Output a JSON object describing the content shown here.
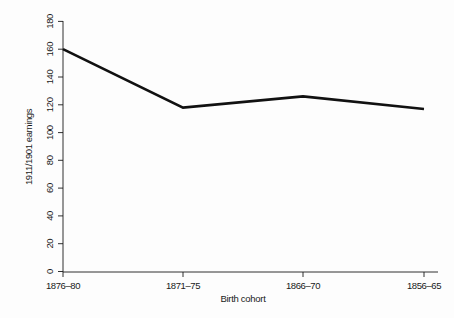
{
  "chart_data": {
    "type": "line",
    "title": "",
    "subtitle": "",
    "xlabel": "Birth cohort",
    "ylabel": "1911/1901 earnings",
    "categories": [
      "1876–80",
      "1871–75",
      "1866–70",
      "1856–65"
    ],
    "values": [
      160,
      118,
      126,
      117
    ],
    "series": [
      {
        "name": "1911/1901 earnings",
        "values": [
          160,
          118,
          126,
          117
        ]
      }
    ],
    "ylim": [
      0,
      180
    ],
    "yticks": [
      0,
      20,
      40,
      60,
      80,
      100,
      120,
      140,
      160,
      180
    ],
    "ytick_labels": [
      "0",
      "20",
      "40",
      "60",
      "80",
      "100",
      "120",
      "140",
      "160",
      "180"
    ],
    "xticks": [
      "1876–80",
      "1871–75",
      "1866–70",
      "1856–65"
    ],
    "grid": false,
    "legend": false,
    "legend_position": "none",
    "line_color": "#111111",
    "axis_color": "#1a1a1a",
    "background_color": "#fdfdfd",
    "y_tick_label_rotation": 90
  }
}
